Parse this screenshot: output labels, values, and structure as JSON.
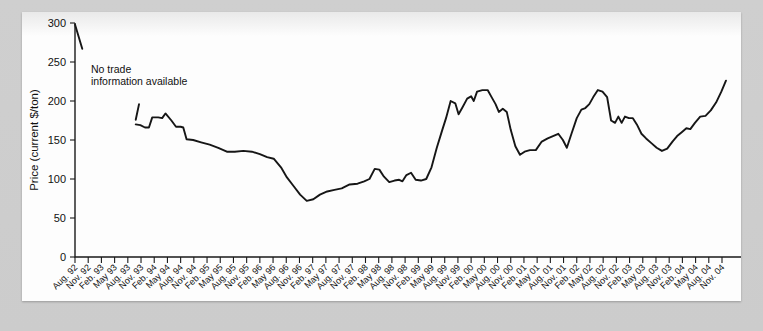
{
  "figure": {
    "background_color": "#cccccc",
    "page_color": "#fdfdfd",
    "line_color": "#161616"
  },
  "annotation": {
    "line1": "No trade",
    "line2": "information available"
  },
  "chart_data": {
    "type": "line",
    "title": "",
    "xlabel": "Date",
    "ylabel": "Price (current $/ton)",
    "ylim": [
      0,
      300
    ],
    "yticks": [
      0,
      50,
      100,
      150,
      200,
      250,
      300
    ],
    "grid": false,
    "legend": "none",
    "xlabel_rotation_deg": 45,
    "categories": [
      "Aug. 92",
      "Nov. 92",
      "Feb. 93",
      "May 93",
      "Aug. 93",
      "Nov. 93",
      "Feb. 94",
      "May 94",
      "Aug. 94",
      "Nov. 94",
      "Feb. 95",
      "May 95",
      "Aug. 95",
      "Nov. 95",
      "Feb. 96",
      "May 96",
      "Aug. 96",
      "Nov. 96",
      "Feb. 97",
      "May 97",
      "Aug. 97",
      "Nov. 97",
      "Feb. 98",
      "May 98",
      "Aug. 98",
      "Nov. 98",
      "Feb. 99",
      "May 99",
      "Aug. 99",
      "Nov. 99",
      "Feb. 00",
      "May 00",
      "Aug. 00",
      "Nov. 00",
      "Feb. 01",
      "May 01",
      "Aug. 01",
      "Nov. 01",
      "Feb. 02",
      "May 02",
      "Aug. 02",
      "Nov. 02",
      "Feb. 03",
      "May 03",
      "Aug. 03",
      "Nov. 03",
      "Feb. 04",
      "May 04",
      "Aug. 04",
      "Nov. 04"
    ],
    "series": [
      {
        "name": "Price",
        "note": "Monthly observations; gap between Aug. 92 and Nov. 93 is 'No trade information available'.",
        "segments": [
          {
            "name": "pre-gap",
            "points": [
              {
                "x": 0.0,
                "y": 298
              },
              {
                "x": 0.55,
                "y": 267
              }
            ]
          },
          {
            "name": "stub",
            "points": [
              {
                "x": 4.85,
                "y": 196
              },
              {
                "x": 4.6,
                "y": 176
              }
            ]
          },
          {
            "name": "main",
            "points": [
              {
                "x": 4.6,
                "y": 170
              },
              {
                "x": 4.95,
                "y": 169
              },
              {
                "x": 5.3,
                "y": 166
              },
              {
                "x": 5.6,
                "y": 166
              },
              {
                "x": 5.85,
                "y": 179
              },
              {
                "x": 6.3,
                "y": 179
              },
              {
                "x": 6.6,
                "y": 178
              },
              {
                "x": 6.85,
                "y": 184
              },
              {
                "x": 7.3,
                "y": 175
              },
              {
                "x": 7.65,
                "y": 167
              },
              {
                "x": 8.0,
                "y": 167
              },
              {
                "x": 8.2,
                "y": 166
              },
              {
                "x": 8.45,
                "y": 151
              },
              {
                "x": 8.95,
                "y": 150
              },
              {
                "x": 9.55,
                "y": 147
              },
              {
                "x": 10.2,
                "y": 144
              },
              {
                "x": 10.85,
                "y": 140
              },
              {
                "x": 11.5,
                "y": 135
              },
              {
                "x": 12.1,
                "y": 135
              },
              {
                "x": 12.75,
                "y": 136
              },
              {
                "x": 13.4,
                "y": 135
              },
              {
                "x": 14.0,
                "y": 132
              },
              {
                "x": 14.55,
                "y": 128
              },
              {
                "x": 15.05,
                "y": 126
              },
              {
                "x": 15.6,
                "y": 115
              },
              {
                "x": 16.05,
                "y": 102
              },
              {
                "x": 16.55,
                "y": 91
              },
              {
                "x": 17.05,
                "y": 80
              },
              {
                "x": 17.55,
                "y": 72
              },
              {
                "x": 18.05,
                "y": 74
              },
              {
                "x": 18.55,
                "y": 80
              },
              {
                "x": 19.1,
                "y": 84
              },
              {
                "x": 19.65,
                "y": 86
              },
              {
                "x": 20.2,
                "y": 88
              },
              {
                "x": 20.8,
                "y": 93
              },
              {
                "x": 21.4,
                "y": 94
              },
              {
                "x": 21.9,
                "y": 97
              },
              {
                "x": 22.3,
                "y": 100
              },
              {
                "x": 22.7,
                "y": 113
              },
              {
                "x": 23.05,
                "y": 112
              },
              {
                "x": 23.4,
                "y": 103
              },
              {
                "x": 23.8,
                "y": 96
              },
              {
                "x": 24.2,
                "y": 98
              },
              {
                "x": 24.55,
                "y": 99
              },
              {
                "x": 24.8,
                "y": 97
              },
              {
                "x": 25.1,
                "y": 105
              },
              {
                "x": 25.45,
                "y": 108
              },
              {
                "x": 25.8,
                "y": 99
              },
              {
                "x": 26.2,
                "y": 98
              },
              {
                "x": 26.6,
                "y": 100
              },
              {
                "x": 27.0,
                "y": 115
              },
              {
                "x": 27.4,
                "y": 140
              },
              {
                "x": 27.8,
                "y": 162
              },
              {
                "x": 28.1,
                "y": 178
              },
              {
                "x": 28.45,
                "y": 200
              },
              {
                "x": 28.8,
                "y": 197
              },
              {
                "x": 29.05,
                "y": 183
              },
              {
                "x": 29.35,
                "y": 192
              },
              {
                "x": 29.7,
                "y": 203
              },
              {
                "x": 30.0,
                "y": 206
              },
              {
                "x": 30.2,
                "y": 200
              },
              {
                "x": 30.45,
                "y": 212
              },
              {
                "x": 30.85,
                "y": 214
              },
              {
                "x": 31.25,
                "y": 214
              },
              {
                "x": 31.55,
                "y": 205
              },
              {
                "x": 31.85,
                "y": 196
              },
              {
                "x": 32.1,
                "y": 186
              },
              {
                "x": 32.4,
                "y": 190
              },
              {
                "x": 32.7,
                "y": 186
              },
              {
                "x": 33.0,
                "y": 163
              },
              {
                "x": 33.35,
                "y": 142
              },
              {
                "x": 33.7,
                "y": 131
              },
              {
                "x": 34.05,
                "y": 135
              },
              {
                "x": 34.45,
                "y": 137
              },
              {
                "x": 34.9,
                "y": 137
              },
              {
                "x": 35.35,
                "y": 148
              },
              {
                "x": 35.8,
                "y": 152
              },
              {
                "x": 36.2,
                "y": 155
              },
              {
                "x": 36.6,
                "y": 158
              },
              {
                "x": 36.95,
                "y": 150
              },
              {
                "x": 37.25,
                "y": 140
              },
              {
                "x": 37.6,
                "y": 158
              },
              {
                "x": 38.0,
                "y": 178
              },
              {
                "x": 38.35,
                "y": 189
              },
              {
                "x": 38.65,
                "y": 191
              },
              {
                "x": 38.95,
                "y": 196
              },
              {
                "x": 39.25,
                "y": 205
              },
              {
                "x": 39.6,
                "y": 214
              },
              {
                "x": 39.95,
                "y": 212
              },
              {
                "x": 40.3,
                "y": 205
              },
              {
                "x": 40.6,
                "y": 175
              },
              {
                "x": 40.9,
                "y": 172
              },
              {
                "x": 41.15,
                "y": 180
              },
              {
                "x": 41.4,
                "y": 172
              },
              {
                "x": 41.65,
                "y": 180
              },
              {
                "x": 41.95,
                "y": 178
              },
              {
                "x": 42.25,
                "y": 178
              },
              {
                "x": 42.55,
                "y": 170
              },
              {
                "x": 42.9,
                "y": 158
              },
              {
                "x": 43.25,
                "y": 152
              },
              {
                "x": 43.65,
                "y": 146
              },
              {
                "x": 44.05,
                "y": 140
              },
              {
                "x": 44.45,
                "y": 136
              },
              {
                "x": 44.85,
                "y": 139
              },
              {
                "x": 45.25,
                "y": 148
              },
              {
                "x": 45.6,
                "y": 155
              },
              {
                "x": 45.95,
                "y": 160
              },
              {
                "x": 46.3,
                "y": 165
              },
              {
                "x": 46.6,
                "y": 164
              },
              {
                "x": 46.95,
                "y": 172
              },
              {
                "x": 47.35,
                "y": 180
              },
              {
                "x": 47.75,
                "y": 181
              },
              {
                "x": 48.15,
                "y": 188
              },
              {
                "x": 48.55,
                "y": 198
              },
              {
                "x": 48.95,
                "y": 212
              },
              {
                "x": 49.3,
                "y": 226
              }
            ]
          }
        ]
      }
    ]
  }
}
